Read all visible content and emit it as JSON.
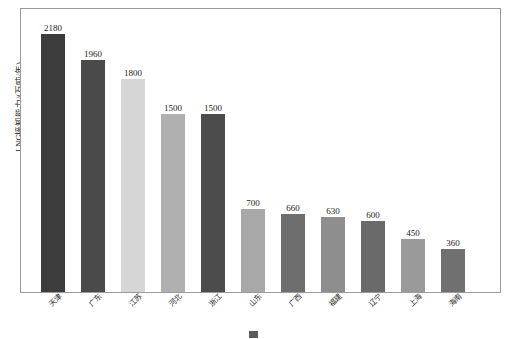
{
  "chart_data": {
    "type": "bar",
    "title": "",
    "subtitle": "",
    "xlabel": "",
    "ylabel": "LNG接卸能力/(万吨/年)",
    "ylim": [
      0,
      2400
    ],
    "grid": false,
    "legend": "none",
    "categories": [
      "天津",
      "广东",
      "江苏",
      "河北",
      "浙江",
      "山东",
      "广西",
      "福建",
      "辽宁",
      "上海",
      "海南"
    ],
    "values": [
      2180,
      1960,
      1800,
      1500,
      1500,
      700,
      660,
      630,
      600,
      450,
      360
    ],
    "value_labels": [
      "2180",
      "1960",
      "1800",
      "1500",
      "1500",
      "700",
      "660",
      "630",
      "600",
      "450",
      "360"
    ],
    "bar_colors": [
      "#3c3c3c",
      "#4a4a4a",
      "#d6d6d6",
      "#b0b0b0",
      "#4c4c4c",
      "#a8a8a8",
      "#6e6e6e",
      "#8e8e8e",
      "#6a6a6a",
      "#9a9a9a",
      "#707070"
    ]
  },
  "figure": {
    "caption": "",
    "caption_swatch_color": "#5b5b5b",
    "frame_color": "#9a9a9a",
    "background": "#ffffff"
  }
}
